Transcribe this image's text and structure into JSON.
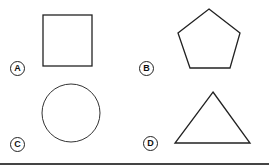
{
  "options": [
    {
      "letter": "A",
      "shape": "square"
    },
    {
      "letter": "B",
      "shape": "pentagon"
    },
    {
      "letter": "C",
      "shape": "circle"
    },
    {
      "letter": "D",
      "shape": "triangle"
    }
  ],
  "colors": {
    "stroke": "#222222",
    "background": "#ffffff"
  }
}
